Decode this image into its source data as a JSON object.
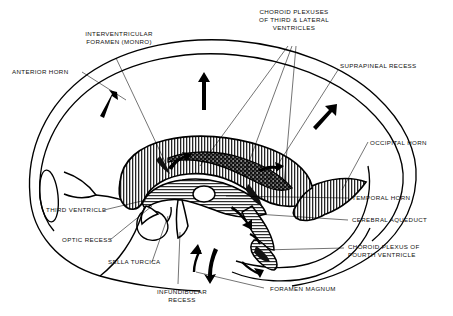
{
  "figure": {
    "type": "anatomical-diagram",
    "style": "black-and-white line drawing with hatched and stippled fills"
  },
  "labels": {
    "anterior_horn": "ANTERIOR HORN",
    "interventricular_foramen": "INTERVENTRICULAR\nFORAMEN (MONRO)",
    "choroid_plexuses": "CHOROID PLEXUSES\nOF THIRD & LATERAL\nVENTRICLES",
    "suprapineal_recess": "SUPRAPINEAL RECESS",
    "occipital_horn": "OCCIPITAL HORN",
    "temporal_horn": "TEMPORAL HORN",
    "cerebral_aqueduct": "CEREBRAL AQUEDUCT",
    "choroid_plexus_fourth": "CHOROID PLEXUS OF\nFOURTH VENTRICLE",
    "foramen_magnum": "FORAMEN MAGNUM",
    "infundibular_recess": "INFUNDIBULAR\nRECESS",
    "sella_turcica": "SELLA TURCICA",
    "optic_recess": "OPTIC RECESS",
    "third_ventricle": "THIRD VENTRICLE"
  },
  "colors": {
    "ink": "#000000",
    "background": "#ffffff",
    "hatch_fill": "#c9c9c9",
    "plexus_fill": "#1a1a1a"
  }
}
